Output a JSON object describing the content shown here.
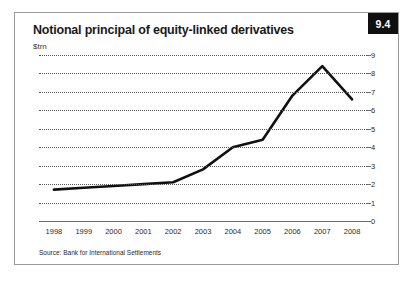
{
  "figure": {
    "title": "Notional principal of equity-linked derivatives",
    "subtitle": "$trn",
    "badge": "9.4",
    "source": "Source: Bank for International Settlements"
  },
  "colors": {
    "line": "#101010",
    "grid": "#555555",
    "axis": "#6f6f6f",
    "badge_bg": "#101010",
    "badge_text": "#ffffff",
    "border": "#9a9a9a",
    "background": "#ffffff"
  },
  "chart_data": {
    "type": "line",
    "title": "Notional principal of equity-linked derivatives",
    "subtitle": "$trn",
    "xlabel": "",
    "ylabel": "$trn",
    "categories": [
      "1998",
      "1999",
      "2000",
      "2001",
      "2002",
      "2003",
      "2004",
      "2005",
      "2006",
      "2007",
      "2008"
    ],
    "x": [
      1998,
      1999,
      2000,
      2001,
      2002,
      2003,
      2004,
      2005,
      2006,
      2007,
      2008
    ],
    "values": [
      1.7,
      1.8,
      1.9,
      2.0,
      2.1,
      2.8,
      4.0,
      4.4,
      6.8,
      8.4,
      6.6
    ],
    "series": [
      {
        "name": "Notional principal of equity-linked derivatives",
        "values": [
          1.7,
          1.8,
          1.9,
          2.0,
          2.1,
          2.8,
          4.0,
          4.4,
          6.8,
          8.4,
          6.6
        ]
      }
    ],
    "ylim": [
      0,
      9
    ],
    "yticks": [
      0,
      1,
      2,
      3,
      4,
      5,
      6,
      7,
      8,
      9
    ],
    "ytick_labels": [
      "0",
      "1",
      "2",
      "3",
      "4",
      "5",
      "6",
      "7",
      "8",
      "9"
    ],
    "y_axis_position": "right",
    "grid": true,
    "grid_style": "dotted-horizontal",
    "legend": false,
    "legend_position": "none",
    "annotations": []
  }
}
